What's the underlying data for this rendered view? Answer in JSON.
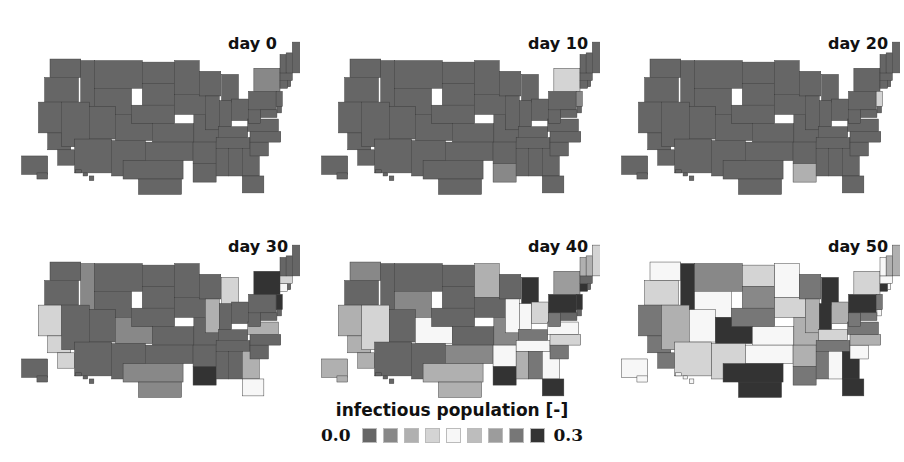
{
  "figure": {
    "panels": [
      {
        "label": "day 0"
      },
      {
        "label": "day 10"
      },
      {
        "label": "day 20"
      },
      {
        "label": "day 30"
      },
      {
        "label": "day 40"
      },
      {
        "label": "day 50"
      }
    ],
    "legend": {
      "title": "infectious population [-]",
      "min_label": "0.0",
      "max_label": "0.3",
      "colors": [
        "#666666",
        "#888888",
        "#b0b0b0",
        "#d4d4d4",
        "#f7f7f7",
        "#bdbdbd",
        "#9c9c9c",
        "#777777",
        "#333333"
      ]
    }
  },
  "chart_data": {
    "type": "heatmap",
    "subtype": "choropleth-small-multiples",
    "title": "",
    "colorbar_label": "infectious population [-]",
    "color_range": [
      0.0,
      0.3
    ],
    "color_bins": 9,
    "panels": [
      {
        "label": "day 0",
        "base_bin": 0,
        "states": {
          "NY": 1
        }
      },
      {
        "label": "day 10",
        "base_bin": 0,
        "states": {
          "NY": 3,
          "NJ": 1,
          "LA": 1
        }
      },
      {
        "label": "day 20",
        "base_bin": 0,
        "states": {
          "NJ": 3,
          "LA": 2
        }
      },
      {
        "label": "day 30",
        "base_bin": 0,
        "states": {
          "NY": 8,
          "NJ": 8,
          "CT": 4,
          "LA": 8,
          "CA": 3,
          "ID": 1,
          "CO": 1,
          "IL": 2,
          "MI": 3,
          "TX": 1,
          "VA": 2,
          "GA": 2,
          "FL": 4,
          "MA": 3
        }
      },
      {
        "label": "day 40",
        "base_bin": 0,
        "states": {
          "WA": 1,
          "CA": 2,
          "NV": 3,
          "CO": 4,
          "MN": 2,
          "IL": 4,
          "IN": 4,
          "OH": 3,
          "MI": 8,
          "PA": 8,
          "NJ": 8,
          "CT": 8,
          "NY": 6,
          "VA": 4,
          "NC": 3,
          "TN": 4,
          "AR": 4,
          "GA": 4,
          "LA": 8,
          "FL": 8,
          "TX": 2,
          "OK": 1,
          "MO": 1,
          "AK": 2,
          "MS": 2,
          "ME": 3,
          "KY": 7,
          "WV": 7,
          "MT": 0,
          "WI": 0,
          "SC": 7,
          "AL": 7,
          "OR": 0,
          "WY": 1,
          "VT": 2,
          "NH": 2
        }
      },
      {
        "label": "day 50",
        "base_bin": 2,
        "states": {
          "WA": 4,
          "OR": 3,
          "ID": 8,
          "MT": 1,
          "ND": 3,
          "MN": 4,
          "WI": 7,
          "MI": 8,
          "WY": 4,
          "SD": 1,
          "NE": 7,
          "IA": 3,
          "IL": 2,
          "IN": 8,
          "OH": 2,
          "PA": 8,
          "NY": 3,
          "VT": 4,
          "NH": 2,
          "ME": 2,
          "MA": 4,
          "CT": 8,
          "NJ": 7,
          "CA": 7,
          "NV": 2,
          "UT": 4,
          "CO": 8,
          "KS": 4,
          "MO": 2,
          "KY": 3,
          "WV": 7,
          "VA": 7,
          "NC": 2,
          "TN": 7,
          "AZ": 3,
          "NM": 3,
          "OK": 4,
          "AR": 2,
          "MS": 7,
          "AL": 4,
          "GA": 8,
          "SC": 4,
          "TX": 8,
          "LA": 7,
          "FL": 8,
          "AK": 4,
          "HI": 4,
          "MD": 7,
          "DE": 4,
          "RI": 4
        }
      }
    ],
    "legend_position": "bottom-center"
  }
}
